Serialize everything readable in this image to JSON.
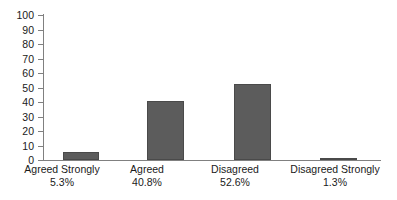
{
  "chart_data": {
    "type": "bar",
    "title": "",
    "subtitle": "",
    "xlabel": "",
    "ylabel": "",
    "ylim": [
      0,
      100
    ],
    "yticks": [
      0,
      10,
      20,
      30,
      40,
      50,
      60,
      70,
      80,
      90,
      100
    ],
    "grid": false,
    "legend": "none",
    "orientation": "vertical",
    "bar_color": "#5c5c5c",
    "axis_color": "#808080",
    "text_color": "#1a1a1a",
    "background": "#ffffff",
    "categories": [
      "Agreed Strongly",
      "Agreed",
      "Disagreed",
      "Disagreed Strongly"
    ],
    "value_labels": [
      "5.3%",
      "40.8%",
      "52.6%",
      "1.3%"
    ],
    "values": [
      5.3,
      40.8,
      52.6,
      1.3
    ],
    "series": [
      {
        "name": "Response share",
        "values": [
          5.3,
          40.8,
          52.6,
          1.3
        ]
      }
    ],
    "points": [
      {
        "category": "Agreed Strongly",
        "value": 5.3,
        "label": "5.3%"
      },
      {
        "category": "Agreed",
        "value": 40.8,
        "label": "40.8%"
      },
      {
        "category": "Disagreed",
        "value": 52.6,
        "label": "52.6%"
      },
      {
        "category": "Disagreed Strongly",
        "value": 1.3,
        "label": "1.3%"
      }
    ]
  },
  "axis": {
    "y_tick_labels": [
      "100",
      "90",
      "80",
      "70",
      "60",
      "50",
      "40",
      "30",
      "20",
      "10",
      "0"
    ]
  }
}
